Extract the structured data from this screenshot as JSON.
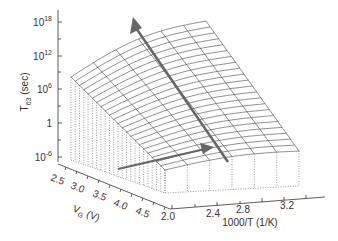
{
  "chart_data": {
    "type": "surface3d",
    "title": "",
    "zlabel": "T63 (sec)",
    "zlabel_main": "T",
    "zlabel_sub": "63",
    "zlabel_unit": "(sec)",
    "z_scale": "log",
    "z_ticks": [
      {
        "base": "10",
        "exp": "18",
        "value": 1e+18
      },
      {
        "base": "10",
        "exp": "12",
        "value": 1000000000000.0
      },
      {
        "base": "10",
        "exp": "6",
        "value": 1000000.0
      },
      {
        "base": "1",
        "exp": "",
        "value": 1
      },
      {
        "base": "10",
        "exp": "-6",
        "value": 1e-06
      }
    ],
    "ylabel": "VG (V)",
    "ylabel_main": "V",
    "ylabel_sub": "G",
    "ylabel_unit": "(V)",
    "y_ticks": [
      "2.5",
      "3.0",
      "3.5",
      "4.0",
      "4.5"
    ],
    "xlabel": "1000/T (1/K)",
    "x_ticks": [
      "2.0",
      "2.4",
      "2.8",
      "3.2"
    ],
    "surface_description": "T63 increases with 1000/T (Arrhenius) and decreases with VG; wireframe mesh with dotted side faces",
    "annotations": [
      {
        "type": "arrow",
        "description": "large arrow pointing toward increasing 1000/T and T63"
      },
      {
        "type": "arrow",
        "description": "arrow along V_G direction on the surface"
      }
    ],
    "grid": false,
    "legend": null
  },
  "colors": {
    "mesh": "#444444",
    "arrow": "#6a6a6a",
    "axis": "#333333",
    "background": "#ffffff"
  }
}
